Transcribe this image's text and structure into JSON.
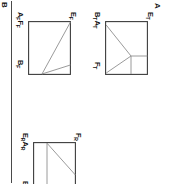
{
  "figure": {
    "orientation": "rotated-90-clockwise",
    "background_color": "#ffffff",
    "line_color": "#3c3c3c",
    "inner_line_color": "#8f8f8f",
    "panel_tags": [
      {
        "name": "panel-tag-a",
        "text": "A"
      },
      {
        "name": "panel-tag-b",
        "text": "B"
      }
    ],
    "panels": [
      {
        "id": "panel-tension",
        "tag": "A",
        "labels": {
          "top_left": "B A",
          "top_left_main": "B",
          "top_left_sub": "T",
          "top_left_second_main": "A",
          "top_left_second_sub": "T",
          "top_right_main": "F",
          "top_right_sub": "T",
          "bottom_left_main": "E",
          "bottom_left_sub": "T"
        }
      },
      {
        "id": "panel-flexion",
        "tag": "B",
        "labels": {
          "top_left_main": "A",
          "top_left_sub": "F",
          "top_left_second_main": "F",
          "top_left_second_sub": "F",
          "top_right_main": "B",
          "top_right_sub": "F",
          "bottom_left_main": "E",
          "bottom_left_sub": "F"
        }
      },
      {
        "id": "panel-relaxation",
        "tag": "B",
        "labels": {
          "top_left_main": "E",
          "top_left_sub": "R",
          "top_left_second_main": "A",
          "top_left_second_sub": "R",
          "top_right_main": "B",
          "top_right_sub": "R",
          "bottom_left_main": "F",
          "bottom_left_sub": "R"
        }
      }
    ]
  }
}
